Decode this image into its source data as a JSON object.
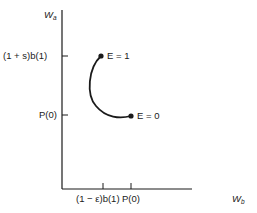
{
  "diagram": {
    "axes": {
      "y_axis": {
        "label_main": "W",
        "label_sub": "a"
      },
      "x_axis": {
        "label_main": "W",
        "label_sub": "b"
      }
    },
    "y_ticks": [
      {
        "label": "(1 + s)b(1)"
      },
      {
        "label": "P(0)"
      }
    ],
    "x_ticks": [
      {
        "label": "(1 − ε)b(1)"
      },
      {
        "label": "P(0)"
      }
    ],
    "points": [
      {
        "label": "E = 1"
      },
      {
        "label": "E = 0"
      }
    ],
    "colors": {
      "line": "#1a1a1a",
      "background": "#ffffff"
    }
  }
}
